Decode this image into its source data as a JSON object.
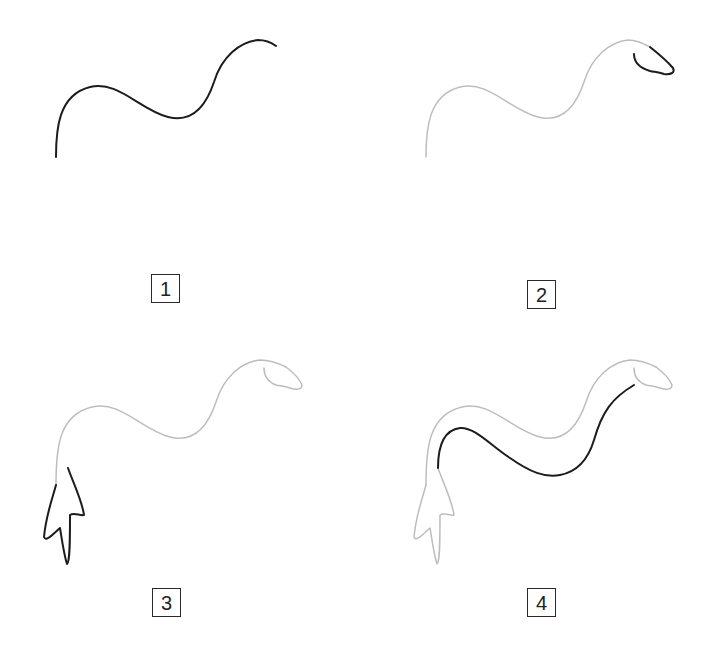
{
  "colors": {
    "current_stroke": "#1c1c1c",
    "previous_strokes": "#bdbdbd",
    "background": "#ffffff"
  },
  "steps": [
    {
      "number": "1",
      "description": "Draw a wavy S-shaped line for the back and neck"
    },
    {
      "number": "2",
      "description": "Add the head at the end of the neck"
    },
    {
      "number": "3",
      "description": "Draw the tail fin at the bottom-left"
    },
    {
      "number": "4",
      "description": "Draw the underside line of the body"
    }
  ]
}
